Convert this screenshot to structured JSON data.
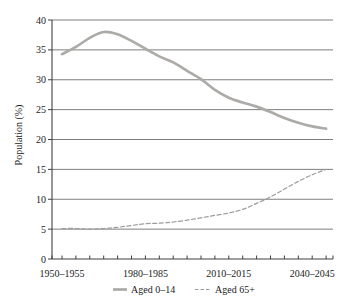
{
  "figure": {
    "background": "#ffffff",
    "text_color": "#1c1c1c",
    "grid_color": "#6f6f6f",
    "axis_color": "#404040"
  },
  "chart_data": {
    "type": "line",
    "title": "",
    "xlabel": "",
    "ylabel": "Population (%)",
    "ylim": [
      0,
      40
    ],
    "yticks": [
      0,
      5,
      10,
      15,
      20,
      25,
      30,
      35,
      40
    ],
    "grid": "horizontal",
    "legend_position": "bottom",
    "categories": [
      "1950–1955",
      "1955–1960",
      "1960–1965",
      "1965–1970",
      "1970–1975",
      "1975–1980",
      "1980–1985",
      "1985–1990",
      "1990–1995",
      "1995–2000",
      "2000–2005",
      "2005–2010",
      "2010–2015",
      "2015–2020",
      "2020–2025",
      "2025–2030",
      "2030–2035",
      "2035–2040",
      "2040–2045",
      "2045–2050"
    ],
    "x_tick_labels_shown": [
      "1950–1955",
      "1980–1985",
      "2010–2015",
      "2040–2045"
    ],
    "x_tick_label_indices": [
      0,
      6,
      12,
      18
    ],
    "series": [
      {
        "name": "Aged 0–14",
        "style": "solid",
        "color": "#adaba8",
        "width": 2.7,
        "values": [
          34.3,
          35.5,
          37.0,
          38.0,
          37.6,
          36.5,
          35.2,
          33.9,
          32.9,
          31.5,
          30.1,
          28.3,
          27.0,
          26.2,
          25.5,
          24.6,
          23.6,
          22.8,
          22.2,
          21.8
        ]
      },
      {
        "name": "Aged 65+",
        "style": "dashed",
        "color": "#9c9c9c",
        "width": 1.2,
        "values": [
          5.1,
          5.1,
          5.0,
          5.1,
          5.3,
          5.6,
          5.9,
          6.0,
          6.2,
          6.5,
          6.9,
          7.3,
          7.7,
          8.3,
          9.3,
          10.4,
          11.7,
          13.0,
          14.1,
          15.0
        ]
      }
    ]
  }
}
